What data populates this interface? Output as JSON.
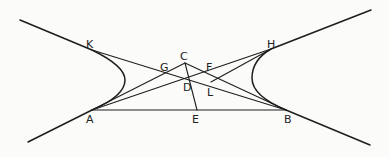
{
  "figure": {
    "points": {
      "A": "A",
      "B": "B",
      "C": "C",
      "D": "D",
      "E": "E",
      "F": "F",
      "G": "G",
      "H": "H",
      "K": "K",
      "L": "L"
    },
    "segments": [
      [
        "A",
        "B"
      ],
      [
        "K",
        "B"
      ],
      [
        "A",
        "H"
      ],
      [
        "A",
        "C"
      ],
      [
        "C",
        "B"
      ],
      [
        "C",
        "E"
      ],
      [
        "L",
        "H"
      ]
    ],
    "curves": [
      "left-hyperbola-branch",
      "right-hyperbola-branch"
    ],
    "line_color": "#1e1e1e",
    "background_color": "#fbfbfa"
  }
}
